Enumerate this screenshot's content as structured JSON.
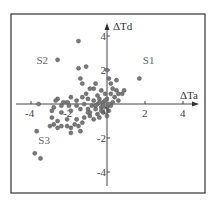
{
  "chart_data": {
    "type": "scatter",
    "title": "",
    "xlabel": "ΔTa",
    "ylabel": "ΔTd",
    "xlim": [
      -4.9,
      4.9
    ],
    "ylim": [
      -5.0,
      5.0
    ],
    "grid": false,
    "legend": null,
    "x_ticks": [
      -4,
      -2,
      2,
      4
    ],
    "y_ticks": [
      4,
      2,
      -2,
      -4
    ],
    "x_tick_labels": [
      "-4",
      "-2",
      "2",
      "4"
    ],
    "y_tick_labels": [
      "4",
      "2",
      "-2",
      "-4"
    ],
    "origin_label": "0",
    "annotations": [
      {
        "text": "S1",
        "x": 2.2,
        "y": 2.6
      },
      {
        "text": "S2",
        "x": -3.4,
        "y": 2.6
      },
      {
        "text": "S3",
        "x": -3.3,
        "y": -2.1
      }
    ],
    "marker_color": "#777777",
    "series": [
      {
        "name": "points",
        "points": [
          [
            -1.5,
            3.7
          ],
          [
            -2.6,
            2.6
          ],
          [
            -1.5,
            2.1
          ],
          [
            -1.1,
            2.2
          ],
          [
            1.7,
            1.5
          ],
          [
            -1.4,
            1.5
          ],
          [
            -1.3,
            1.2
          ],
          [
            -0.6,
            1.2
          ],
          [
            0.0,
            2.0
          ],
          [
            0.1,
            1.5
          ],
          [
            0.2,
            1.2
          ],
          [
            0.5,
            1.4
          ],
          [
            -0.9,
            0.9
          ],
          [
            -0.7,
            0.9
          ],
          [
            -0.3,
            0.8
          ],
          [
            0.3,
            0.9
          ],
          [
            0.5,
            0.8
          ],
          [
            0.9,
            0.8
          ],
          [
            0.8,
            0.6
          ],
          [
            0.6,
            0.6
          ],
          [
            0.2,
            0.6
          ],
          [
            -0.1,
            0.6
          ],
          [
            -0.5,
            0.5
          ],
          [
            -1.1,
            0.6
          ],
          [
            -1.3,
            0.4
          ],
          [
            -1.9,
            0.4
          ],
          [
            -2.6,
            0.3
          ],
          [
            -2.7,
            0.2
          ],
          [
            -2.3,
            0.1
          ],
          [
            -2.1,
            0.1
          ],
          [
            -1.6,
            0.2
          ],
          [
            -1.0,
            0.3
          ],
          [
            -0.7,
            0.2
          ],
          [
            -0.4,
            0.3
          ],
          [
            0.0,
            0.3
          ],
          [
            0.4,
            0.4
          ],
          [
            0.6,
            0.2
          ],
          [
            0.3,
            0.1
          ],
          [
            -0.2,
            0.1
          ],
          [
            -0.5,
            0.0
          ],
          [
            -0.8,
            -0.1
          ],
          [
            -1.2,
            0.0
          ],
          [
            -1.6,
            -0.1
          ],
          [
            -2.0,
            -0.1
          ],
          [
            -2.4,
            -0.1
          ],
          [
            -2.8,
            -0.2
          ],
          [
            -3.6,
            0.0
          ],
          [
            -2.9,
            -0.4
          ],
          [
            -2.4,
            -0.5
          ],
          [
            -1.9,
            -0.4
          ],
          [
            -1.4,
            -0.3
          ],
          [
            -1.0,
            -0.3
          ],
          [
            -0.6,
            -0.3
          ],
          [
            -0.3,
            -0.2
          ],
          [
            0.0,
            -0.2
          ],
          [
            0.1,
            -0.4
          ],
          [
            -0.2,
            -0.5
          ],
          [
            -0.5,
            -0.6
          ],
          [
            -0.9,
            -0.7
          ],
          [
            -1.2,
            -0.8
          ],
          [
            -0.7,
            -0.9
          ],
          [
            -0.4,
            -0.8
          ],
          [
            0.0,
            -0.7
          ],
          [
            -2.9,
            -0.8
          ],
          [
            -2.6,
            -1.0
          ],
          [
            -2.1,
            -0.9
          ],
          [
            -1.6,
            -0.9
          ],
          [
            -1.3,
            -1.1
          ],
          [
            -1.7,
            -1.2
          ],
          [
            -2.8,
            -1.2
          ],
          [
            -3.0,
            -1.3
          ],
          [
            -2.6,
            -1.4
          ],
          [
            -2.4,
            -1.3
          ],
          [
            -2.1,
            -1.3
          ],
          [
            -1.9,
            -1.4
          ],
          [
            -1.5,
            -1.3
          ],
          [
            -1.9,
            -1.7
          ],
          [
            -1.4,
            -1.6
          ],
          [
            -3.7,
            -1.6
          ],
          [
            -3.8,
            -2.9
          ],
          [
            -3.5,
            -3.2
          ],
          [
            -0.9,
            -0.5
          ],
          [
            -0.2,
            -0.1
          ],
          [
            0.2,
            -0.1
          ],
          [
            -0.1,
            0.2
          ],
          [
            -0.4,
            0.1
          ],
          [
            -0.6,
            -0.1
          ],
          [
            0.1,
            0.0
          ],
          [
            -0.3,
            -0.4
          ],
          [
            -1.0,
            -0.5
          ]
        ]
      }
    ]
  }
}
